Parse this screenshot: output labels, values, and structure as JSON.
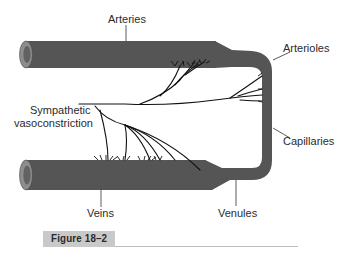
{
  "figure": {
    "caption": "Figure 18–2",
    "labels": {
      "arteries": "Arteries",
      "arterioles": "Arterioles",
      "sympathetic_line1": "Sympathetic",
      "sympathetic_line2": "vasoconstriction",
      "capillaries": "Capillaries",
      "veins": "Veins",
      "venules": "Venules"
    },
    "colors": {
      "vessel": "#555555",
      "vessel_end_outer": "#8a8a8a",
      "vessel_lumen": "#6a6a6a",
      "nerve": "#111111",
      "leader": "#333333",
      "caption_box": "#c9c9c9"
    }
  }
}
